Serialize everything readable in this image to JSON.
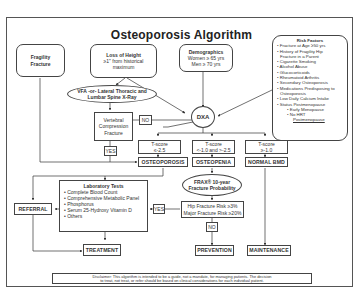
{
  "title": "Osteoporosis Algorithm",
  "nodes": {
    "fragility": {
      "line1": "Fragility",
      "line2": "Fracture"
    },
    "height": {
      "title": "Loss of Height",
      "line1": "≥1\" from historical",
      "line2": "maximum"
    },
    "demographics": {
      "title": "Demographics",
      "line1": "Women ≥ 65 yrs",
      "line2": "Men ≥ 70 yrs"
    },
    "risk_factors": {
      "title": "Risk Factors",
      "items": [
        "• Fracture at Age ≥50 yrs",
        "• History of Fragility Hip",
        "  Fracture in a Parent",
        "• Cigarette Smoking",
        "• Alcohol Abuse",
        "• Glucocorticoids",
        "• Rheumatoid Arthritis",
        "• Secondary Osteoporosis",
        "• Medications Predisposing to",
        "  Osteoporosis",
        "• Low Daily Calcium Intake",
        "• Status Postmenopause"
      ],
      "subitems": [
        "• Early Menopause",
        "• No HRT",
        "Postmenopause"
      ]
    },
    "vfa": {
      "line1": "VFA -or- Lateral Thoracic and",
      "line2": "Lumbar Spine X-Ray"
    },
    "dxa": "DXA",
    "vcf": {
      "line1": "Vertebral",
      "line2": "Compression",
      "line3": "Fracture"
    },
    "no1": "NO",
    "yes1": "YES",
    "tscore1": {
      "line1": "T-score",
      "line2": "≤-2.5"
    },
    "tscore2": {
      "line1": "T-score",
      "line2": "<-1.0 and >-2.5"
    },
    "tscore3": {
      "line1": "T-score",
      "line2": "≥-1.0"
    },
    "osteoporosis": "OSTEOPOROSIS",
    "osteopenia": "OSTEOPENIA",
    "normal_bmd": "NORMAL BMD",
    "frax": {
      "line1": "FRAX® 10-year",
      "line2": "Fracture Probability"
    },
    "labs": {
      "title": "Laboratory Tests",
      "items": [
        "• Complete Blood Count",
        "• Comprehensive Metabolic Panel",
        "• Phosphorus",
        "• Serum 25-Hydroxy Vitamin D",
        "• Others"
      ]
    },
    "referral": "REFERRAL",
    "yes2": "YES",
    "hip_risk": {
      "line1": "Hip Fracture Risk ≥3%",
      "line2": "Major Fracture Risk ≥20%"
    },
    "no2": "NO",
    "treatment": "TREATMENT",
    "prevention": "PREVENTION",
    "maintenance": "MAINTENANCE"
  },
  "disclaimer": {
    "line1": "Disclaimer: This algorithm is intended to be a guide, not a mandate, for managing patients. The decision",
    "line2": "to treat, not treat, or refer should be based on clinical considerations for each individual patient."
  }
}
